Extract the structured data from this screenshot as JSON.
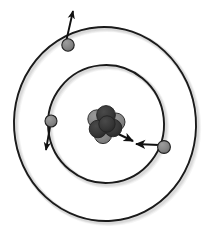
{
  "figure": {
    "title": "Bohr model of an atom",
    "width": 210,
    "height": 238,
    "background_color": "#ffffff"
  },
  "colors": {
    "orbit_stroke": "#1a1a1a",
    "orbit_shadow": "#b9b9b9",
    "electron_fill": "#838383",
    "electron_stroke": "#1f1f1f",
    "proton_fill": "#333333",
    "neutron_fill": "#828282",
    "nucleon_stroke": "#232323",
    "arrow_stroke": "#111111"
  },
  "nucleus": {
    "name": "nucleus",
    "center": {
      "x": 106,
      "y": 124
    },
    "nucleons": [
      {
        "label": "neutron",
        "type": "neutron",
        "cx": 97,
        "cy": 119,
        "r": 9.2
      },
      {
        "label": "neutron",
        "type": "neutron",
        "cx": 116,
        "cy": 122,
        "r": 9.0
      },
      {
        "label": "neutron",
        "type": "neutron",
        "cx": 103,
        "cy": 135,
        "r": 8.6
      },
      {
        "label": "proton",
        "type": "proton",
        "cx": 106,
        "cy": 115,
        "r": 9.4
      },
      {
        "label": "proton",
        "type": "proton",
        "cx": 113,
        "cy": 128,
        "r": 8.8
      },
      {
        "label": "proton",
        "type": "proton",
        "cx": 98,
        "cy": 129,
        "r": 8.8
      },
      {
        "label": "proton",
        "type": "proton",
        "cx": 107,
        "cy": 124,
        "r": 8.2
      }
    ]
  },
  "orbits": [
    {
      "name": "outer-orbit",
      "shell": "outer shell",
      "cx": 105,
      "cy": 124,
      "rx": 91,
      "ry": 97,
      "rotation": -4,
      "stroke_width": 1.9
    },
    {
      "name": "inner-orbit",
      "shell": "inner shell",
      "cx": 106,
      "cy": 124,
      "rx": 58,
      "ry": 59,
      "rotation": -6,
      "stroke_width": 1.9
    }
  ],
  "electrons": [
    {
      "name": "electron-outer-top-left",
      "orbit": "outer-orbit",
      "cx": 68,
      "cy": 45,
      "r": 6.2,
      "velocity_vector": {
        "label": "velocity",
        "x1": 66,
        "y1": 42,
        "x2": 73,
        "y2": 11
      }
    },
    {
      "name": "electron-inner-left",
      "orbit": "inner-orbit",
      "cx": 51,
      "cy": 121,
      "r": 6.0,
      "velocity_vector": {
        "label": "velocity",
        "x1": 50,
        "y1": 127,
        "x2": 46,
        "y2": 150
      }
    },
    {
      "name": "electron-inner-right",
      "orbit": "inner-orbit",
      "cx": 164,
      "cy": 147,
      "r": 6.4,
      "velocity_vector": null
    }
  ],
  "radius_arrow": {
    "name": "orbital-radius-arrow",
    "label": "orbit radius (double-headed)",
    "from": {
      "x": 112,
      "y": 131
    },
    "to": {
      "x": 159,
      "y": 145
    },
    "meet": {
      "x": 134,
      "y": 143
    },
    "head_a": {
      "x": 133,
      "y": 141
    },
    "head_b": {
      "x": 136,
      "y": 144
    }
  }
}
